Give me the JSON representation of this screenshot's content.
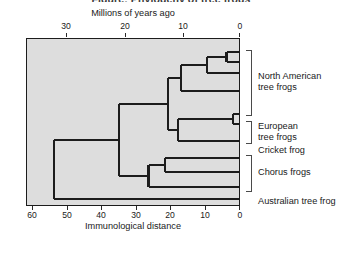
{
  "figure": {
    "title": "Figure: Phylogeny of tree frogs",
    "top_axis_label": "Millions of years ago",
    "bottom_axis_label": "Immunological distance",
    "background_color": "#dddddd",
    "line_color": "#1c1c1c"
  },
  "axes": {
    "top": {
      "label": "Millions of years ago",
      "ticks": [
        30,
        20,
        10,
        0
      ],
      "tick_labels": [
        "30",
        "20",
        "10",
        "0"
      ],
      "range": [
        36.3,
        0
      ]
    },
    "bottom": {
      "label": "Immunological distance",
      "ticks": [
        60,
        50,
        40,
        30,
        20,
        10,
        0
      ],
      "tick_labels": [
        "60",
        "50",
        "40",
        "30",
        "20",
        "10",
        "0"
      ],
      "range": [
        64,
        0
      ]
    }
  },
  "clades": [
    {
      "name": "north-american-tree-frogs",
      "label": "North American\ntree frogs",
      "tips": 4
    },
    {
      "name": "european-tree-frogs",
      "label": "European\ntree frogs",
      "tips": 2
    },
    {
      "name": "cricket-frog",
      "label": "Cricket frog",
      "tips": 1
    },
    {
      "name": "chorus-frogs",
      "label": "Chorus frogs",
      "tips": 3
    },
    {
      "name": "australian-tree-frog",
      "label": "Australian tree frog",
      "tips": 1
    }
  ],
  "chart_data": {
    "type": "line",
    "xlabel": "Immunological distance",
    "ylabel": "",
    "top_axis_label": "Millions of years ago",
    "xlim": [
      64,
      0
    ],
    "grid": false,
    "legend": "none",
    "tips": [
      {
        "index": 0,
        "clade": "North American tree frogs"
      },
      {
        "index": 1,
        "clade": "North American tree frogs"
      },
      {
        "index": 2,
        "clade": "North American tree frogs"
      },
      {
        "index": 3,
        "clade": "North American tree frogs"
      },
      {
        "index": 4,
        "clade": "European tree frogs"
      },
      {
        "index": 5,
        "clade": "European tree frogs"
      },
      {
        "index": 6,
        "clade": "Cricket frog"
      },
      {
        "index": 7,
        "clade": "Chorus frogs"
      },
      {
        "index": 8,
        "clade": "Chorus frogs"
      },
      {
        "index": 9,
        "clade": "Chorus frogs"
      },
      {
        "index": 10,
        "clade": "Australian tree frog"
      }
    ],
    "nodes": [
      {
        "id": "n1",
        "immunological_distance": 4,
        "million_years_ago": 2,
        "children": [
          "tip0",
          "tip1"
        ]
      },
      {
        "id": "n2",
        "immunological_distance": 10,
        "million_years_ago": 6,
        "children": [
          "n1",
          "tip2"
        ]
      },
      {
        "id": "n3",
        "immunological_distance": 18,
        "million_years_ago": 10,
        "children": [
          "n2",
          "tip3"
        ]
      },
      {
        "id": "n4",
        "immunological_distance": 2,
        "million_years_ago": 1,
        "children": [
          "tip4",
          "tip5"
        ]
      },
      {
        "id": "n5",
        "immunological_distance": 19,
        "million_years_ago": 11,
        "children": [
          "n4",
          "tip6"
        ]
      },
      {
        "id": "n6",
        "immunological_distance": 22,
        "million_years_ago": 12,
        "children": [
          "n3",
          "n5"
        ]
      },
      {
        "id": "n7",
        "immunological_distance": 23,
        "million_years_ago": 13,
        "children": [
          "tip7",
          "tip8"
        ]
      },
      {
        "id": "n8",
        "immunological_distance": 28,
        "million_years_ago": 16,
        "children": [
          "n7",
          "tip9"
        ]
      },
      {
        "id": "n9",
        "immunological_distance": 37,
        "million_years_ago": 21,
        "children": [
          "n6",
          "n8"
        ]
      },
      {
        "id": "root",
        "immunological_distance": 57,
        "million_years_ago": 32,
        "children": [
          "n9",
          "tip10"
        ]
      }
    ]
  }
}
